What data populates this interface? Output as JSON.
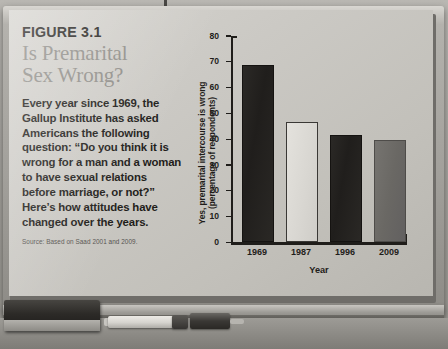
{
  "figure": {
    "number": "FIGURE 3.1",
    "title_line1": "Is Premarital",
    "title_line2": "Sex Wrong?",
    "body": "Every year since 1969, the Gallup Institute has asked Americans the following question: “Do you think it is wrong for a man and a woman to have sexual relations before marriage, or not?” Here’s how attitudes have changed over the years.",
    "source": "Source: Based on Saad 2001 and 2009."
  },
  "chart_data": {
    "type": "bar",
    "title": "",
    "categories": [
      "1969",
      "1987",
      "1996",
      "2009"
    ],
    "values": [
      68,
      46,
      41,
      39
    ],
    "xlabel": "Year",
    "ylabel_line1": "Yes, premarital intercourse is wrong",
    "ylabel_line2": "(percentage of respondents)",
    "ylim": [
      0,
      80
    ],
    "ytick_step": 10,
    "yticks": [
      "0",
      "10",
      "20",
      "30",
      "40",
      "50",
      "60",
      "70",
      "80"
    ],
    "grid": false,
    "legend": "none",
    "bar_styles": [
      "dark",
      "light",
      "dark",
      "mid"
    ],
    "colors": {
      "bar_dark": "#221f1d",
      "bar_light": "#dcdad5",
      "bar_mid": "#6a6864",
      "axis": "#1f1d1a",
      "board": "#c8c6c1",
      "title_gray": "#8f8d88",
      "text_dark": "#1f1d1a"
    }
  },
  "whiteboard": {
    "eraser_label": "eraser",
    "marker_white_label": "white-marker",
    "marker_dark_label": "dark-marker"
  }
}
